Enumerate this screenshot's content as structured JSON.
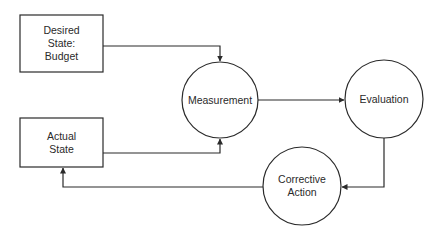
{
  "diagram": {
    "type": "control-loop flowchart",
    "nodes": [
      {
        "id": "desired",
        "shape": "rectangle",
        "label": "Desired\nState:\nBudget"
      },
      {
        "id": "actual",
        "shape": "rectangle",
        "label": "Actual\nState"
      },
      {
        "id": "measurement",
        "shape": "circle",
        "label": "Measurement"
      },
      {
        "id": "evaluation",
        "shape": "circle",
        "label": "Evaluation"
      },
      {
        "id": "corrective",
        "shape": "circle",
        "label": "Corrective\nAction"
      }
    ],
    "edges": [
      {
        "from": "desired",
        "to": "measurement"
      },
      {
        "from": "actual",
        "to": "measurement"
      },
      {
        "from": "measurement",
        "to": "evaluation"
      },
      {
        "from": "evaluation",
        "to": "corrective"
      },
      {
        "from": "corrective",
        "to": "actual"
      }
    ],
    "colors": {
      "stroke": "#2a2a2a",
      "background": "#ffffff"
    }
  }
}
